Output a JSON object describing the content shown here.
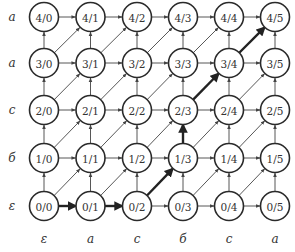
{
  "diagram": {
    "row_labels": [
      "ε",
      "б",
      "c",
      "a",
      "a"
    ],
    "col_labels": [
      "ε",
      "a",
      "c",
      "б",
      "c",
      "a"
    ],
    "nodes_rows": [
      [
        "0/0",
        "0/1",
        "0/2",
        "0/3",
        "0/4",
        "0/5"
      ],
      [
        "1/0",
        "1/1",
        "1/2",
        "1/3",
        "1/4",
        "1/5"
      ],
      [
        "2/0",
        "2/1",
        "2/2",
        "2/3",
        "2/4",
        "2/5"
      ],
      [
        "3/0",
        "3/1",
        "3/2",
        "3/3",
        "3/4",
        "3/5"
      ],
      [
        "4/0",
        "4/1",
        "4/2",
        "4/3",
        "4/4",
        "4/5"
      ]
    ],
    "bold_path": [
      "0/0",
      "0/1",
      "0/2",
      "1/3",
      "2/3",
      "3/4",
      "4/5"
    ],
    "colors": {
      "stroke": "#2a2a2a",
      "text": "#333333",
      "background": "#ffffff"
    }
  }
}
